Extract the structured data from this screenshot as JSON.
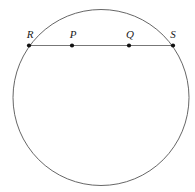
{
  "figure": {
    "name": "circle-with-chord-diagram",
    "type": "geometry-diagram",
    "background_color": "#ffffff",
    "canvas": {
      "width": 195,
      "height": 192
    },
    "circle": {
      "name": "circle",
      "center_x": 101,
      "center_y": 97.5,
      "radius": 88,
      "stroke_color": "#555555",
      "stroke_width": 0.9,
      "fill": "none"
    },
    "chord": {
      "name": "chord-RS",
      "x1": 29,
      "y1": 45.5,
      "x2": 173,
      "y2": 45.5,
      "stroke_color": "#777777",
      "stroke_width": 1.1
    },
    "point_color": "#111111",
    "point_radius": 2.1,
    "label_color": "#1a1a1a",
    "points": [
      {
        "id": "R",
        "label": "R",
        "x": 29,
        "y": 45.5,
        "label_x": 30,
        "label_y": 38,
        "on_circle": true
      },
      {
        "id": "P",
        "label": "P",
        "x": 72,
        "y": 45.5,
        "label_x": 73,
        "label_y": 38,
        "on_circle": false
      },
      {
        "id": "Q",
        "label": "Q",
        "x": 129,
        "y": 45.5,
        "label_x": 130,
        "label_y": 38,
        "on_circle": false
      },
      {
        "id": "S",
        "label": "S",
        "x": 173,
        "y": 45.5,
        "label_x": 173,
        "label_y": 38,
        "on_circle": true
      }
    ]
  }
}
